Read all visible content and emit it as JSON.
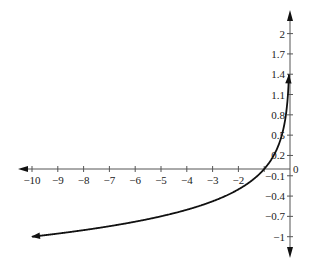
{
  "chart_data": {
    "type": "line",
    "title": "",
    "xlabel": "",
    "ylabel": "",
    "function": "y = log_{1/10}(-x)",
    "xlim": [
      -10,
      0
    ],
    "ylim": [
      -1,
      2
    ],
    "grid": false,
    "legend": null,
    "x_ticks": [
      -10,
      -9,
      -8,
      -7,
      -6,
      -5,
      -4,
      -3,
      -2,
      -1
    ],
    "x_tick_labels": [
      "−10",
      "−9",
      "−8",
      "−7",
      "−6",
      "−5",
      "−4",
      "−3",
      "−2",
      ""
    ],
    "y_ticks": [
      2,
      1.7,
      1.4,
      1.1,
      0.8,
      0.5,
      0.2,
      -0.1,
      -0.4,
      -0.7,
      -1
    ],
    "y_tick_labels": [
      "2",
      "1.7",
      "1.4",
      "1.1",
      "0.8",
      "0.5",
      "0.2",
      "−0.1",
      "−0.4",
      "−0.7",
      "−1"
    ],
    "origin_label": "0",
    "series": [
      {
        "name": "curve",
        "color": "#111111",
        "x": [
          -10,
          -9,
          -8,
          -7,
          -6,
          -5,
          -4,
          -3,
          -2,
          -1,
          -0.5,
          -0.3,
          -0.2,
          -0.1,
          -0.06,
          -0.04
        ],
        "y": [
          -1,
          -0.954,
          -0.903,
          -0.845,
          -0.778,
          -0.699,
          -0.602,
          -0.477,
          -0.301,
          0,
          0.301,
          0.523,
          0.699,
          1,
          1.222,
          1.398
        ]
      }
    ]
  },
  "colors": {
    "axis": "#555555",
    "curve": "#111111",
    "background": "#ffffff"
  }
}
